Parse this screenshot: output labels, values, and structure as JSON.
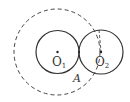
{
  "diagram": {
    "stroke_color": "#333333",
    "circles": [
      {
        "name": "O1",
        "cx": 57,
        "cy": 52,
        "r": 21.5,
        "style": "solid"
      },
      {
        "name": "O2",
        "cx": 101,
        "cy": 52,
        "r": 22,
        "style": "solid"
      },
      {
        "name": "big",
        "cx": 57,
        "cy": 52,
        "r": 43,
        "style": "dashed"
      }
    ],
    "labels": {
      "o1_main": "O",
      "o1_sub": "1",
      "o2_main": "O",
      "o2_sub": "2",
      "point_a": "A"
    }
  }
}
